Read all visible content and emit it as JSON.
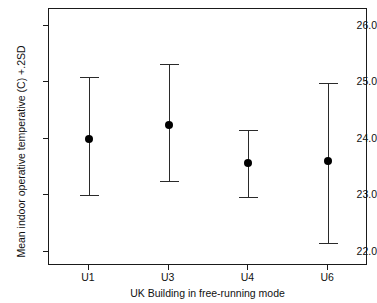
{
  "chart_data": {
    "type": "scatter",
    "title": "",
    "xlabel": "UK Building in free-running mode",
    "ylabel": "Mean indoor operative temperative (C) +.2SD",
    "categories": [
      "U1",
      "U3",
      "U4",
      "U6"
    ],
    "values": [
      24.0,
      24.25,
      23.57,
      23.61
    ],
    "error_low": [
      23.0,
      23.25,
      22.98,
      22.16
    ],
    "error_high": [
      25.1,
      25.32,
      24.15,
      24.99
    ],
    "ylim": [
      21.75,
      26.3
    ],
    "yticks": [
      "22.0",
      "23.0",
      "24.0",
      "25.0",
      "26.0"
    ],
    "ytick_values": [
      22.0,
      23.0,
      24.0,
      25.0,
      26.0
    ],
    "grid": false,
    "legend": "none",
    "marker": "filled-circle",
    "error_bar_style": "capped-whisker",
    "series": [
      {
        "name": "Mean indoor operative temperature",
        "points": [
          {
            "category": "U1",
            "mean": 24.0,
            "lower": 23.0,
            "upper": 25.1
          },
          {
            "category": "U3",
            "mean": 24.25,
            "lower": 23.25,
            "upper": 25.32
          },
          {
            "category": "U4",
            "mean": 23.57,
            "lower": 22.98,
            "upper": 24.15
          },
          {
            "category": "U6",
            "mean": 23.61,
            "lower": 22.16,
            "upper": 24.99
          }
        ]
      }
    ]
  },
  "axes": {
    "y_title": "Mean indoor operative temperative (C) +.2SD",
    "x_title": "UK Building in free-running mode"
  },
  "colors": {
    "marker": "#000000",
    "error_bar": "#2a2a2a",
    "axis": "#1a1a1a",
    "background": "#ffffff",
    "text": "#111111"
  }
}
